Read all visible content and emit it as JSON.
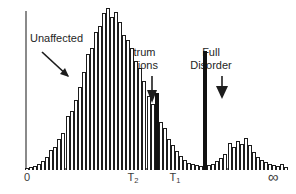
{
  "figure": {
    "background": "#ffffff",
    "axis_color": "#6f6f6f",
    "bar_edge_color": "#1c1c1c",
    "bar_fill_color": "#ffffff",
    "highlight_color": "#111111"
  },
  "annotations": {
    "unaffected": {
      "label": "Unaffected",
      "x": 30,
      "y": 32
    },
    "spectrum": {
      "label": "Spectrum\nConditions",
      "x": 132,
      "y": 46
    },
    "full_disorder": {
      "label": "Full\nDisorder",
      "x": 211,
      "y": 46
    }
  },
  "axis": {
    "ticks": [
      {
        "label": "0",
        "sub": "",
        "x": 27
      },
      {
        "label": "T",
        "sub": "2",
        "x": 133
      },
      {
        "label": "T",
        "sub": "1",
        "x": 175
      },
      {
        "label": "∞",
        "sub": "",
        "x": 273
      }
    ]
  },
  "chart_data": {
    "type": "bar",
    "title": "",
    "subtitle": "",
    "xlabel": "",
    "ylabel": "",
    "grid": false,
    "legend_position": "none",
    "xlim": [
      0,
      263
    ],
    "ylim": [
      0,
      162
    ],
    "x_tick_labels": [
      "0",
      "T2",
      "T1",
      "∞"
    ],
    "categories": [
      "b1",
      "b2",
      "b3",
      "b4",
      "b5",
      "b6",
      "b7",
      "b8",
      "b9",
      "b10",
      "b11",
      "b12",
      "b13",
      "b14",
      "b15",
      "b16",
      "b17",
      "b18",
      "b19",
      "b20",
      "b21",
      "b22",
      "b23",
      "b24",
      "b25",
      "b26",
      "b27",
      "b28",
      "b29",
      "b30",
      "b31",
      "b32",
      "b33",
      "b34",
      "b35",
      "b36",
      "b37",
      "b38",
      "b39",
      "b40",
      "b41",
      "b42",
      "b43",
      "b44",
      "b45",
      "b46",
      "b47",
      "b48",
      "b49",
      "b50",
      "b51",
      "b52",
      "b53",
      "b54",
      "b55",
      "b56",
      "b57",
      "b58",
      "b59",
      "b60",
      "b61",
      "b62",
      "b63",
      "b64",
      "b65"
    ],
    "values": [
      2,
      3,
      4,
      6,
      9,
      13,
      19,
      22,
      30,
      36,
      52,
      57,
      68,
      80,
      95,
      112,
      118,
      134,
      140,
      152,
      157,
      148,
      153,
      143,
      131,
      126,
      118,
      106,
      99,
      86,
      72,
      64,
      75,
      47,
      41,
      30,
      24,
      18,
      14,
      10,
      7,
      6,
      5,
      4,
      115,
      5,
      6,
      9,
      12,
      16,
      26,
      22,
      28,
      25,
      31,
      24,
      17,
      13,
      10,
      8,
      6,
      5,
      4,
      6,
      3
    ],
    "bar_fills": [
      "open",
      "open",
      "open",
      "open",
      "open",
      "open",
      "open",
      "open",
      "open",
      "open",
      "open",
      "open",
      "open",
      "open",
      "open",
      "open",
      "open",
      "open",
      "open",
      "open",
      "open",
      "open",
      "open",
      "open",
      "open",
      "open",
      "open",
      "open",
      "open",
      "open",
      "open",
      "open",
      "filled",
      "open",
      "open",
      "open",
      "open",
      "open",
      "open",
      "open",
      "open",
      "open",
      "open",
      "open",
      "filled",
      "open",
      "open",
      "open",
      "open",
      "open",
      "open",
      "open",
      "open",
      "open",
      "open",
      "open",
      "open",
      "open",
      "open",
      "open",
      "open",
      "open",
      "open",
      "open",
      "open"
    ],
    "bar_width": 4.05,
    "markers": [
      {
        "name": "T2",
        "x": 133,
        "kind": "threshold"
      },
      {
        "name": "T1",
        "x": 175,
        "kind": "threshold"
      }
    ]
  }
}
